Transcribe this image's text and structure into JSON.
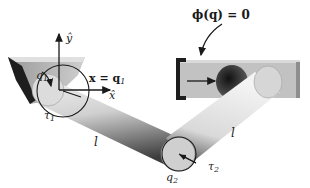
{
  "diagram": {
    "title": "",
    "constraint_label": "ϕ(q) = 0",
    "labels": {
      "y_axis": "ŷ",
      "x_axis": "x̂",
      "x_eq": "x = q",
      "x_eq_sub": "1",
      "q1": "q",
      "q1_sub": "1",
      "tau1": "τ",
      "tau1_sub": "1",
      "link1_length": "l",
      "link2_length": "l",
      "q2": "q",
      "q2_sub": "2",
      "tau2": "τ",
      "tau2_sub": "2"
    },
    "colors": {
      "background": "#ffffff",
      "ink": "#1a1a1a",
      "link_light": "#e6e6e6",
      "link_dark": "#555555",
      "slider_face": "#bdbdbd",
      "slider_dark": "#2a2a2a"
    }
  }
}
